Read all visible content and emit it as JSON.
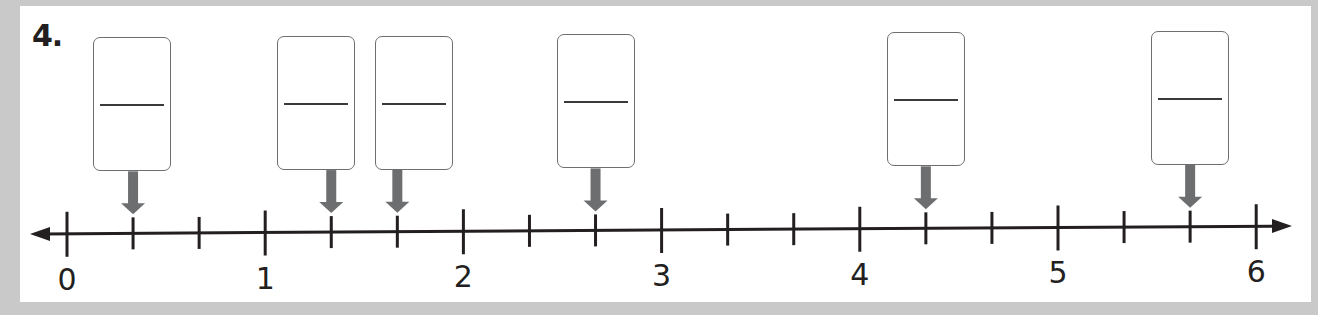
{
  "problem": {
    "number_label": "4."
  },
  "number_line": {
    "min": 0,
    "max": 6,
    "subdivisions_per_unit": 3,
    "major_labels": [
      "0",
      "1",
      "2",
      "3",
      "4",
      "5",
      "6"
    ],
    "arrows_both_ends": true
  },
  "answer_boxes": [
    {
      "points_to": "1/3",
      "value": 0.3333,
      "numerator": "",
      "denominator": ""
    },
    {
      "points_to": "1 1/3",
      "value": 1.3333,
      "numerator": "",
      "denominator": ""
    },
    {
      "points_to": "1 2/3",
      "value": 1.6667,
      "numerator": "",
      "denominator": ""
    },
    {
      "points_to": "2 2/3",
      "value": 2.6667,
      "numerator": "",
      "denominator": ""
    },
    {
      "points_to": "4 1/3",
      "value": 4.3333,
      "numerator": "",
      "denominator": ""
    },
    {
      "points_to": "5 2/3",
      "value": 5.6667,
      "numerator": "",
      "denominator": ""
    }
  ],
  "colors": {
    "line": "#231f20",
    "pointer_arrow": "#6d6e70",
    "box_border": "#6d6e70",
    "background": "#c9c9c9",
    "card": "#ffffff"
  }
}
